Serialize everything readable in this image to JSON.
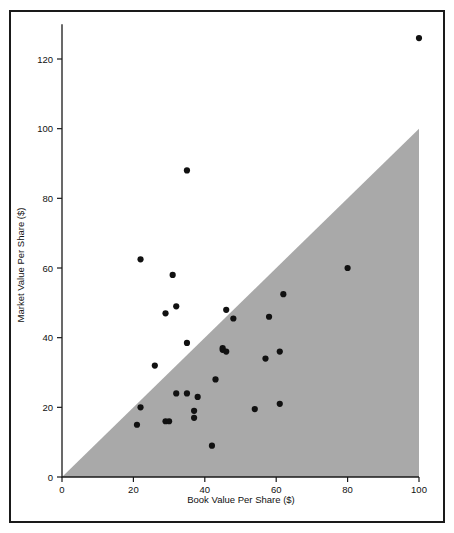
{
  "figure": {
    "background_color": "#ffffff",
    "border_color": "#1a1a1a",
    "point_color": "#111111",
    "region_color": "#a9a9a9"
  },
  "chart_data": {
    "type": "scatter",
    "title": "",
    "xlabel": "Book Value Per Share ($)",
    "ylabel": "Market Value Per Share ($)",
    "xlim": [
      0,
      100
    ],
    "ylim": [
      0,
      130
    ],
    "xticks": [
      0,
      20,
      40,
      60,
      80,
      100
    ],
    "yticks": [
      0,
      20,
      40,
      60,
      80,
      100,
      120
    ],
    "xtick_labels": [
      "0",
      "20",
      "40",
      "60",
      "80",
      "100"
    ],
    "ytick_labels": [
      "0",
      "20",
      "40",
      "60",
      "80",
      "100",
      "120"
    ],
    "grid": false,
    "legend": null,
    "shaded_region": {
      "name": "market-below-book-region",
      "description": "Shaded triangle where market value per share is less than book value per share",
      "color": "#a9a9a9",
      "polygon": [
        [
          0,
          0
        ],
        [
          100,
          100
        ],
        [
          100,
          0
        ]
      ]
    },
    "points": [
      {
        "x": 21,
        "y": 15
      },
      {
        "x": 22,
        "y": 20
      },
      {
        "x": 22,
        "y": 62.5
      },
      {
        "x": 26,
        "y": 32
      },
      {
        "x": 29,
        "y": 16
      },
      {
        "x": 29,
        "y": 47
      },
      {
        "x": 30,
        "y": 16
      },
      {
        "x": 31,
        "y": 58
      },
      {
        "x": 32,
        "y": 24
      },
      {
        "x": 32,
        "y": 49
      },
      {
        "x": 35,
        "y": 24
      },
      {
        "x": 35,
        "y": 38.5
      },
      {
        "x": 35,
        "y": 88
      },
      {
        "x": 37,
        "y": 17
      },
      {
        "x": 37,
        "y": 19
      },
      {
        "x": 38,
        "y": 23
      },
      {
        "x": 42,
        "y": 9
      },
      {
        "x": 43,
        "y": 28
      },
      {
        "x": 45,
        "y": 36.5
      },
      {
        "x": 45,
        "y": 37
      },
      {
        "x": 46,
        "y": 36
      },
      {
        "x": 46,
        "y": 48
      },
      {
        "x": 48,
        "y": 45.5
      },
      {
        "x": 54,
        "y": 19.5
      },
      {
        "x": 57,
        "y": 34
      },
      {
        "x": 58,
        "y": 46
      },
      {
        "x": 61,
        "y": 21
      },
      {
        "x": 61,
        "y": 36
      },
      {
        "x": 62,
        "y": 52.5
      },
      {
        "x": 80,
        "y": 60
      },
      {
        "x": 100,
        "y": 126
      }
    ]
  }
}
